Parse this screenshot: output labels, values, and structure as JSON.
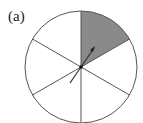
{
  "figure": {
    "label": "(a)",
    "spinner": {
      "sectors": 6,
      "shaded_sector_index": 0,
      "shaded_color": "#8a8a8a",
      "line_color": "#555555",
      "arrow_color": "#333333"
    }
  }
}
